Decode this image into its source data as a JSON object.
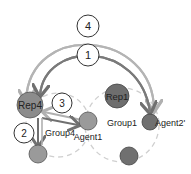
{
  "diagram": {
    "nodes": {
      "rep4": {
        "label": "Rep4",
        "color": "#8c8c8c"
      },
      "rep1": {
        "label": "Rep1",
        "color": "#6e6e6e"
      },
      "agent1": {
        "label": "Agent1",
        "color": "#9a9a9a"
      },
      "agent2": {
        "label": "Agent2'",
        "color": "#707070"
      },
      "group4_member": {
        "label": "",
        "color": "#9a9a9a"
      },
      "group1_member": {
        "label": "",
        "color": "#707070"
      }
    },
    "groups": {
      "group4": {
        "label": "Group4"
      },
      "group1": {
        "label": "Group1"
      }
    },
    "steps": [
      {
        "label": "4"
      },
      {
        "label": "1"
      },
      {
        "label": "3"
      },
      {
        "label": "2"
      }
    ],
    "colors": {
      "arc_outer": "#b4b4b4",
      "arc_inner": "#7a7a7a",
      "dashed": "#cfcfcf"
    }
  }
}
